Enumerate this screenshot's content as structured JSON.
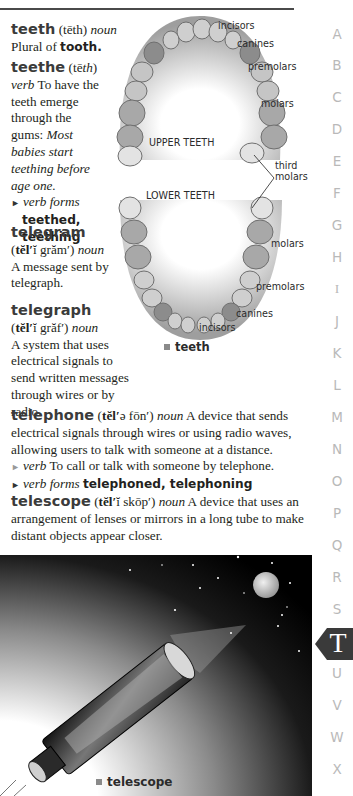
{
  "entries": {
    "teeth": {
      "headword": "teeth",
      "pron": "(tēth)",
      "pos": "noun",
      "def_prefix": "Plural of",
      "def_ref": "tooth."
    },
    "teethe": {
      "headword": "teethe",
      "pron_open": "(tē",
      "pron_italic": "th",
      "pron_close": ")",
      "pos": "verb",
      "def": "To have the teeth emerge through the gums:",
      "example": "Most babies start teething before age one.",
      "forms_label": "verb forms",
      "forms": "teethed, teething"
    },
    "telegram": {
      "headword": "telegram",
      "pron_open": "(",
      "pron_bold": "tĕl′",
      "pron_rest": "ĭ grăm′)",
      "pos": "noun",
      "def": "A message sent by telegraph."
    },
    "telegraph": {
      "headword": "telegraph",
      "pron_open": "(",
      "pron_bold": "tĕl′",
      "pron_rest": "ĭ grăf′)",
      "pos": "noun",
      "def": "A system that uses electrical signals to send written messages through wires or by radio."
    },
    "telephone": {
      "headword": "telephone",
      "pron_open": "(",
      "pron_bold": "tĕl′",
      "pron_rest": "ə fōn′)",
      "pos": "noun",
      "def": "A device that sends electrical signals through wires or using radio waves, allowing users to talk with someone at a distance.",
      "verb_label": "verb",
      "verb_def": "To call or talk with someone by telephone.",
      "forms_label": "verb forms",
      "forms": "telephoned, telephoning"
    },
    "telescope": {
      "headword": "telescope",
      "pron_open": "(",
      "pron_bold": "tĕl′",
      "pron_rest": "ĭ skōp′)",
      "pos": "noun",
      "def": "A device that uses an arrangement of lenses or mirrors in a long tube to make distant objects appear closer."
    }
  },
  "teeth_figure": {
    "labels": {
      "incisors_top": "incisors",
      "canines_top": "canines",
      "premolars_top": "premolars",
      "molars_top": "molars",
      "upper": "UPPER TEETH",
      "third_molars_1": "third",
      "third_molars_2": "molars",
      "lower": "LOWER TEETH",
      "molars_bottom": "molars",
      "premolars_bottom": "premolars",
      "canines_bottom": "canines",
      "incisors_bottom": "incisors"
    },
    "caption": "teeth"
  },
  "telescope_figure": {
    "caption": "telescope"
  },
  "alphabet": {
    "letters": [
      "A",
      "B",
      "C",
      "D",
      "E",
      "F",
      "G",
      "H",
      "I",
      "J",
      "K",
      "L",
      "M",
      "N",
      "O",
      "P",
      "Q",
      "R",
      "S",
      "T",
      "U",
      "V",
      "W",
      "X"
    ],
    "active": "T",
    "active_color": "#3a3a3a",
    "inactive_color": "#b9b9b9"
  }
}
